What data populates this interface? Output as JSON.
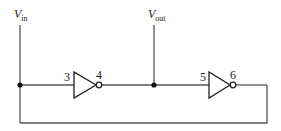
{
  "diagram": {
    "type": "circuit",
    "terminals": {
      "vin": {
        "main": "V",
        "sub": "in"
      },
      "vout": {
        "main": "V",
        "sub": "out"
      }
    },
    "gates": [
      {
        "name": "inverter-1",
        "input_pin": "3",
        "output_pin": "4"
      },
      {
        "name": "inverter-2",
        "input_pin": "5",
        "output_pin": "6"
      }
    ],
    "colors": {
      "wire": "#555555",
      "gate": "#222222",
      "background": "#ffffff"
    }
  }
}
